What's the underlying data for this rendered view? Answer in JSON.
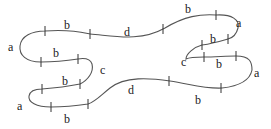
{
  "diagram": {
    "type": "closed-curve-with-labeled-segments",
    "stroke_color": "#555555",
    "text_color": "#222222",
    "segments": [
      {
        "label": "a",
        "x": 13,
        "y": 47
      },
      {
        "label": "b",
        "x": 64,
        "y": 35
      },
      {
        "label": "d",
        "x": 126,
        "y": 36
      },
      {
        "label": "b",
        "x": 187,
        "y": 13
      },
      {
        "label": "a",
        "x": 237,
        "y": 26
      },
      {
        "label": "b",
        "x": 211,
        "y": 43
      },
      {
        "label": "c",
        "x": 183,
        "y": 63
      },
      {
        "label": "b",
        "x": 218,
        "y": 61
      },
      {
        "label": "a",
        "x": 254,
        "y": 74
      },
      {
        "label": "b",
        "x": 197,
        "y": 104
      },
      {
        "label": "d",
        "x": 129,
        "y": 94
      },
      {
        "label": "b",
        "x": 66,
        "y": 123
      },
      {
        "label": "a",
        "x": 18,
        "y": 110
      },
      {
        "label": "b",
        "x": 64,
        "y": 85
      },
      {
        "label": "c",
        "x": 100,
        "y": 72
      },
      {
        "label": "b",
        "x": 55,
        "y": 56
      }
    ]
  }
}
